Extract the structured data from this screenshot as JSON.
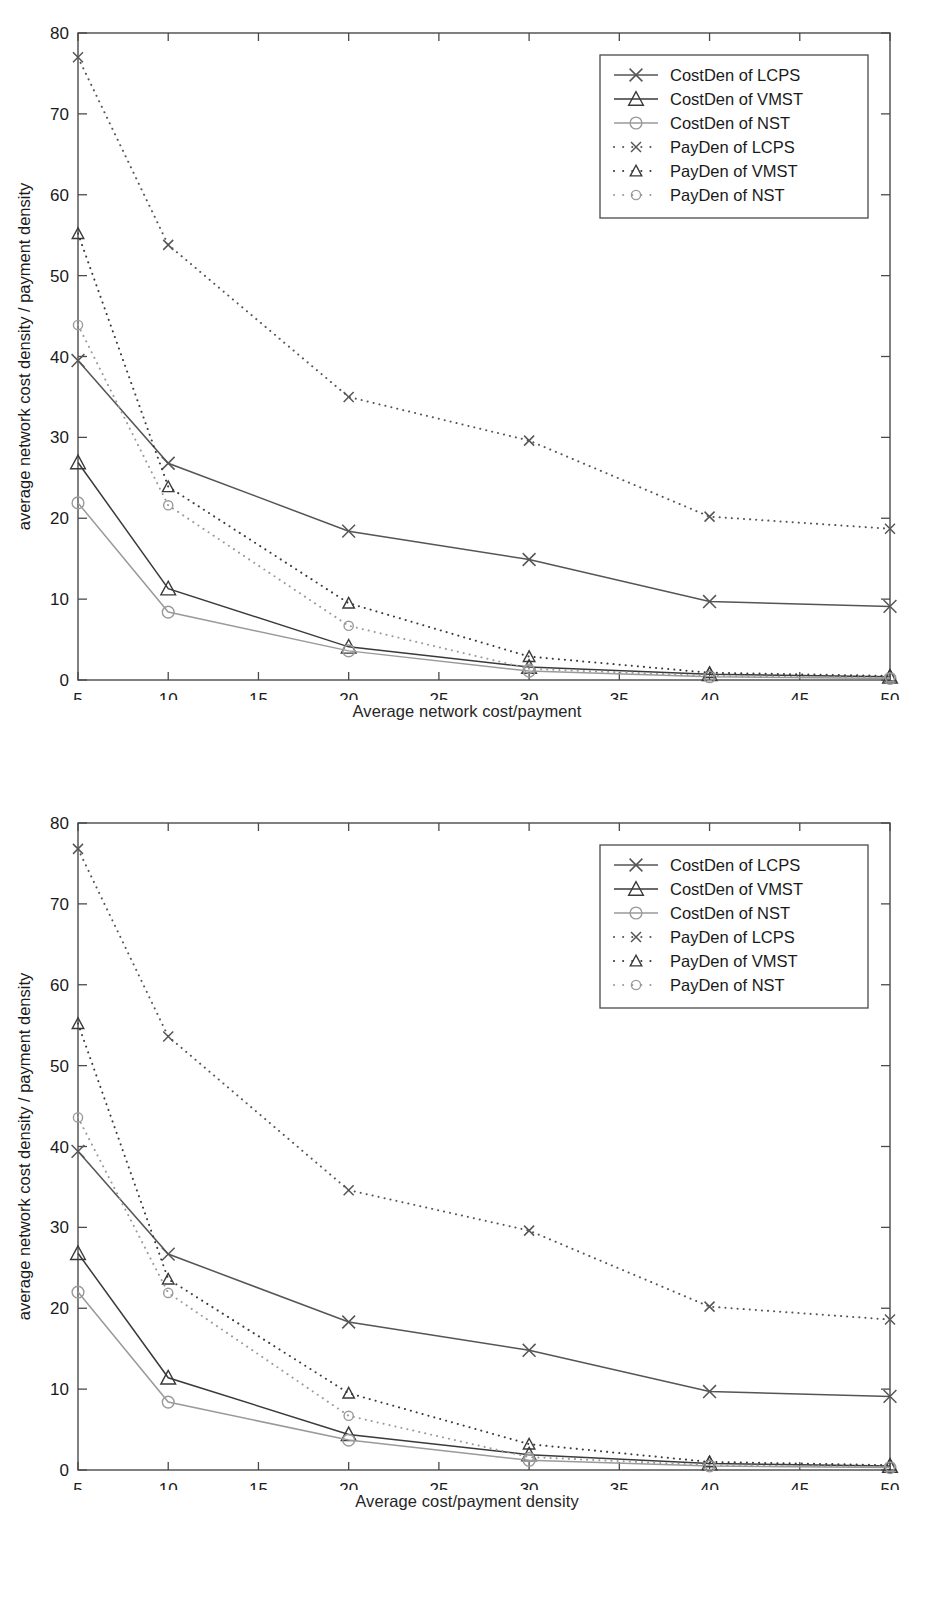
{
  "figures": [
    {
      "caption": "Average network cost/payment",
      "chart_index": 0
    },
    {
      "caption": "Average cost/payment density",
      "chart_index": 1
    }
  ],
  "chart_data": [
    {
      "type": "line",
      "title": "",
      "caption": "Average network cost/payment",
      "xlabel": "number of receiving terminals",
      "ylabel": "average network cost density / payment density",
      "x": [
        5,
        10,
        20,
        30,
        40,
        50
      ],
      "xlim": [
        5,
        50
      ],
      "ylim": [
        0,
        80
      ],
      "xticks": [
        5,
        10,
        15,
        20,
        25,
        30,
        35,
        40,
        45,
        50
      ],
      "yticks": [
        0,
        10,
        20,
        30,
        40,
        50,
        60,
        70,
        80
      ],
      "grid": false,
      "legend_position": "top-right",
      "series": [
        {
          "name": "CostDen of LCPS",
          "marker": "x",
          "linestyle": "solid",
          "color": "#555555",
          "values": [
            39.5,
            26.8,
            18.4,
            14.9,
            9.7,
            9.1
          ]
        },
        {
          "name": "CostDen of VMST",
          "marker": "triangle",
          "linestyle": "solid",
          "color": "#3a3a3a",
          "values": [
            26.9,
            11.3,
            4.1,
            1.6,
            0.7,
            0.4
          ]
        },
        {
          "name": "CostDen of NST",
          "marker": "circle",
          "linestyle": "solid",
          "color": "#9a9a9a",
          "values": [
            21.9,
            8.4,
            3.6,
            1.1,
            0.4,
            0.2
          ]
        },
        {
          "name": "PayDen of LCPS",
          "marker": "x",
          "linestyle": "dotted",
          "color": "#555555",
          "values": [
            77.0,
            53.8,
            35.0,
            29.6,
            20.2,
            18.7
          ]
        },
        {
          "name": "PayDen of VMST",
          "marker": "triangle",
          "linestyle": "dotted",
          "color": "#3a3a3a",
          "values": [
            55.2,
            23.9,
            9.5,
            2.9,
            0.9,
            0.5
          ]
        },
        {
          "name": "PayDen of NST",
          "marker": "circle",
          "linestyle": "dotted",
          "color": "#9a9a9a",
          "values": [
            43.9,
            21.6,
            6.7,
            1.4,
            0.5,
            0.3
          ]
        }
      ]
    },
    {
      "type": "line",
      "title": "",
      "caption": "Average cost/payment density",
      "xlabel": "number of receiving terminals",
      "ylabel": "average network cost density / payment density",
      "x": [
        5,
        10,
        20,
        30,
        40,
        50
      ],
      "xlim": [
        5,
        50
      ],
      "ylim": [
        0,
        80
      ],
      "xticks": [
        5,
        10,
        15,
        20,
        25,
        30,
        35,
        40,
        45,
        50
      ],
      "yticks": [
        0,
        10,
        20,
        30,
        40,
        50,
        60,
        70,
        80
      ],
      "grid": false,
      "legend_position": "top-right",
      "series": [
        {
          "name": "CostDen of LCPS",
          "marker": "x",
          "linestyle": "solid",
          "color": "#555555",
          "values": [
            39.4,
            26.7,
            18.3,
            14.8,
            9.7,
            9.1
          ]
        },
        {
          "name": "CostDen of VMST",
          "marker": "triangle",
          "linestyle": "solid",
          "color": "#3a3a3a",
          "values": [
            26.8,
            11.4,
            4.4,
            1.9,
            0.8,
            0.5
          ]
        },
        {
          "name": "CostDen of NST",
          "marker": "circle",
          "linestyle": "solid",
          "color": "#9a9a9a",
          "values": [
            22.0,
            8.4,
            3.7,
            1.2,
            0.5,
            0.3
          ]
        },
        {
          "name": "PayDen of LCPS",
          "marker": "x",
          "linestyle": "dotted",
          "color": "#555555",
          "values": [
            76.8,
            53.6,
            34.6,
            29.6,
            20.2,
            18.6
          ]
        },
        {
          "name": "PayDen of VMST",
          "marker": "triangle",
          "linestyle": "dotted",
          "color": "#3a3a3a",
          "values": [
            55.2,
            23.6,
            9.5,
            3.2,
            1.0,
            0.6
          ]
        },
        {
          "name": "PayDen of NST",
          "marker": "circle",
          "linestyle": "dotted",
          "color": "#9a9a9a",
          "values": [
            43.6,
            21.9,
            6.7,
            1.6,
            0.6,
            0.4
          ]
        }
      ]
    }
  ],
  "axis_style": {
    "axis_color": "#4a4a4a",
    "text_color": "#1a1a1a",
    "legend_border_color": "#4a4a4a",
    "background": "#ffffff"
  }
}
